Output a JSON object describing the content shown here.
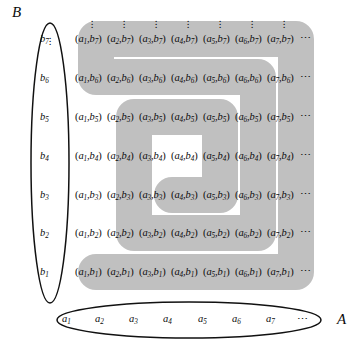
{
  "figure": {
    "colors": {
      "path_fill": "#c0c0c0",
      "ink": "#0c0c0c",
      "background": "#ffffff"
    }
  },
  "sets": {
    "a_set": {
      "label": "A",
      "elements": [
        "a1",
        "a2",
        "a3",
        "a4",
        "a5",
        "a6",
        "a7"
      ],
      "element_labels": [
        {
          "base": "a",
          "sub": "1"
        },
        {
          "base": "a",
          "sub": "2"
        },
        {
          "base": "a",
          "sub": "3"
        },
        {
          "base": "a",
          "sub": "4"
        },
        {
          "base": "a",
          "sub": "5"
        },
        {
          "base": "a",
          "sub": "6"
        },
        {
          "base": "a",
          "sub": "7"
        }
      ],
      "ellipsis": "⋯"
    },
    "b_set": {
      "label": "B",
      "elements": [
        "b1",
        "b2",
        "b3",
        "b4",
        "b5",
        "b6",
        "b7"
      ],
      "element_labels": [
        {
          "base": "b",
          "sub": "1"
        },
        {
          "base": "b",
          "sub": "2"
        },
        {
          "base": "b",
          "sub": "3"
        },
        {
          "base": "b",
          "sub": "4"
        },
        {
          "base": "b",
          "sub": "5"
        },
        {
          "base": "b",
          "sub": "6"
        },
        {
          "base": "b",
          "sub": "7"
        }
      ],
      "ellipsis": "⋮"
    }
  },
  "grid": {
    "row_ellipsis": "⋯",
    "column_ellipsis": "⋮",
    "rows": [
      {
        "row_key": "b7",
        "cells": [
          {
            "a": "a",
            "a_sub": "1",
            "b": "b",
            "b_sub": "7"
          },
          {
            "a": "a",
            "a_sub": "2",
            "b": "b",
            "b_sub": "7"
          },
          {
            "a": "a",
            "a_sub": "3",
            "b": "b",
            "b_sub": "7"
          },
          {
            "a": "a",
            "a_sub": "4",
            "b": "b",
            "b_sub": "7"
          },
          {
            "a": "a",
            "a_sub": "5",
            "b": "b",
            "b_sub": "7"
          },
          {
            "a": "a",
            "a_sub": "6",
            "b": "b",
            "b_sub": "7"
          },
          {
            "a": "a",
            "a_sub": "7",
            "b": "b",
            "b_sub": "7"
          }
        ]
      },
      {
        "row_key": "b6",
        "cells": [
          {
            "a": "a",
            "a_sub": "1",
            "b": "b",
            "b_sub": "6"
          },
          {
            "a": "a",
            "a_sub": "2",
            "b": "b",
            "b_sub": "6"
          },
          {
            "a": "a",
            "a_sub": "3",
            "b": "b",
            "b_sub": "6"
          },
          {
            "a": "a",
            "a_sub": "4",
            "b": "b",
            "b_sub": "6"
          },
          {
            "a": "a",
            "a_sub": "5",
            "b": "b",
            "b_sub": "6"
          },
          {
            "a": "a",
            "a_sub": "6",
            "b": "b",
            "b_sub": "6"
          },
          {
            "a": "a",
            "a_sub": "7",
            "b": "b",
            "b_sub": "6"
          }
        ]
      },
      {
        "row_key": "b5",
        "cells": [
          {
            "a": "a",
            "a_sub": "1",
            "b": "b",
            "b_sub": "5"
          },
          {
            "a": "a",
            "a_sub": "2",
            "b": "b",
            "b_sub": "5"
          },
          {
            "a": "a",
            "a_sub": "3",
            "b": "b",
            "b_sub": "5"
          },
          {
            "a": "a",
            "a_sub": "4",
            "b": "b",
            "b_sub": "5"
          },
          {
            "a": "a",
            "a_sub": "5",
            "b": "b",
            "b_sub": "5"
          },
          {
            "a": "a",
            "a_sub": "6",
            "b": "b",
            "b_sub": "5"
          },
          {
            "a": "a",
            "a_sub": "7",
            "b": "b",
            "b_sub": "5"
          }
        ]
      },
      {
        "row_key": "b4",
        "cells": [
          {
            "a": "a",
            "a_sub": "1",
            "b": "b",
            "b_sub": "4"
          },
          {
            "a": "a",
            "a_sub": "2",
            "b": "b",
            "b_sub": "4"
          },
          {
            "a": "a",
            "a_sub": "3",
            "b": "b",
            "b_sub": "4"
          },
          {
            "a": "a",
            "a_sub": "4",
            "b": "b",
            "b_sub": "4"
          },
          {
            "a": "a",
            "a_sub": "5",
            "b": "b",
            "b_sub": "4"
          },
          {
            "a": "a",
            "a_sub": "6",
            "b": "b",
            "b_sub": "4"
          },
          {
            "a": "a",
            "a_sub": "7",
            "b": "b",
            "b_sub": "4"
          }
        ]
      },
      {
        "row_key": "b3",
        "cells": [
          {
            "a": "a",
            "a_sub": "1",
            "b": "b",
            "b_sub": "3"
          },
          {
            "a": "a",
            "a_sub": "2",
            "b": "b",
            "b_sub": "3"
          },
          {
            "a": "a",
            "a_sub": "3",
            "b": "b",
            "b_sub": "3"
          },
          {
            "a": "a",
            "a_sub": "4",
            "b": "b",
            "b_sub": "3"
          },
          {
            "a": "a",
            "a_sub": "5",
            "b": "b",
            "b_sub": "3"
          },
          {
            "a": "a",
            "a_sub": "6",
            "b": "b",
            "b_sub": "3"
          },
          {
            "a": "a",
            "a_sub": "7",
            "b": "b",
            "b_sub": "3"
          }
        ]
      },
      {
        "row_key": "b2",
        "cells": [
          {
            "a": "a",
            "a_sub": "1",
            "b": "b",
            "b_sub": "2"
          },
          {
            "a": "a",
            "a_sub": "2",
            "b": "b",
            "b_sub": "2"
          },
          {
            "a": "a",
            "a_sub": "3",
            "b": "b",
            "b_sub": "2"
          },
          {
            "a": "a",
            "a_sub": "4",
            "b": "b",
            "b_sub": "2"
          },
          {
            "a": "a",
            "a_sub": "5",
            "b": "b",
            "b_sub": "2"
          },
          {
            "a": "a",
            "a_sub": "6",
            "b": "b",
            "b_sub": "2"
          },
          {
            "a": "a",
            "a_sub": "7",
            "b": "b",
            "b_sub": "2"
          }
        ]
      },
      {
        "row_key": "b1",
        "cells": [
          {
            "a": "a",
            "a_sub": "1",
            "b": "b",
            "b_sub": "1"
          },
          {
            "a": "a",
            "a_sub": "2",
            "b": "b",
            "b_sub": "1"
          },
          {
            "a": "a",
            "a_sub": "3",
            "b": "b",
            "b_sub": "1"
          },
          {
            "a": "a",
            "a_sub": "4",
            "b": "b",
            "b_sub": "1"
          },
          {
            "a": "a",
            "a_sub": "5",
            "b": "b",
            "b_sub": "1"
          },
          {
            "a": "a",
            "a_sub": "6",
            "b": "b",
            "b_sub": "1"
          },
          {
            "a": "a",
            "a_sub": "7",
            "b": "b",
            "b_sub": "1"
          }
        ]
      }
    ]
  }
}
